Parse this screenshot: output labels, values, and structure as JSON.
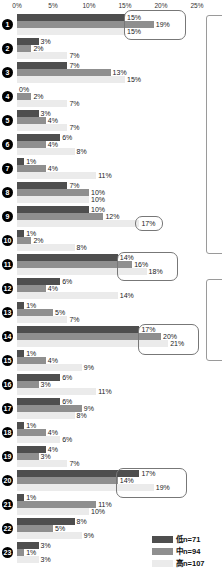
{
  "chart_data": {
    "type": "bar",
    "orientation": "horizontal",
    "title": "",
    "x_axis": {
      "tick_labels": [
        "0%",
        "5%",
        "10%",
        "15%",
        "20%",
        "25%"
      ],
      "tick_values": [
        0,
        5,
        10,
        15,
        20,
        25
      ],
      "min": 0,
      "max": 25,
      "gridlines": false
    },
    "value_suffix": "%",
    "categories": [
      "1",
      "2",
      "3",
      "4",
      "5",
      "6",
      "7",
      "8",
      "9",
      "10",
      "11",
      "12",
      "13",
      "14",
      "15",
      "16",
      "17",
      "18",
      "19",
      "20",
      "21",
      "22",
      "23"
    ],
    "series": [
      {
        "name": "低n=71",
        "color": "#4e4e4e",
        "values": [
          15,
          3,
          7,
          0,
          3,
          6,
          1,
          7,
          10,
          1,
          14,
          6,
          1,
          17,
          1,
          6,
          6,
          1,
          4,
          17,
          1,
          8,
          3
        ]
      },
      {
        "name": "中n=94",
        "color": "#8f8f8f",
        "values": [
          19,
          2,
          13,
          2,
          4,
          4,
          4,
          10,
          12,
          2,
          16,
          4,
          5,
          20,
          4,
          3,
          9,
          4,
          3,
          14,
          11,
          5,
          1
        ]
      },
      {
        "name": "高n=107",
        "color": "#ebebeb",
        "values": [
          15,
          7,
          15,
          7,
          7,
          8,
          11,
          10,
          17,
          8,
          18,
          14,
          7,
          21,
          9,
          11,
          8,
          6,
          7,
          19,
          10,
          9,
          3
        ]
      }
    ],
    "highlighted_groups": [
      1,
      11,
      14,
      20
    ],
    "highlighted_value": {
      "group": 9,
      "series": "高n=107",
      "label": "17%"
    },
    "legend": {
      "position": "bottom-right",
      "items": [
        {
          "label": "低n=71",
          "color": "#4e4e4e"
        },
        {
          "label": "中n=94",
          "color": "#8f8f8f"
        },
        {
          "label": "高n=107",
          "color": "#ebebeb"
        }
      ]
    }
  }
}
